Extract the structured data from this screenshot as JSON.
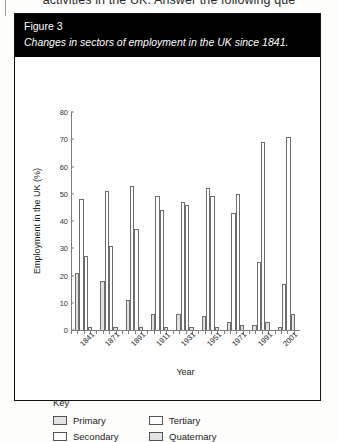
{
  "page": {
    "cut_off_text": "activities in the UK. Answer the following que"
  },
  "figure": {
    "number_label": "Figure 3",
    "caption": "Changes in sectors of employment in the UK since 1841."
  },
  "key": {
    "title": "Key",
    "items": [
      {
        "label": "Primary",
        "style": "fill"
      },
      {
        "label": "Tertiary",
        "style": "empty"
      },
      {
        "label": "Secondary",
        "style": "empty"
      },
      {
        "label": "Quaternary",
        "style": "fill"
      }
    ]
  },
  "chart_data": {
    "type": "bar",
    "title": "Changes in sectors of employment in the UK since 1841.",
    "xlabel": "Year",
    "ylabel": "Employment in the UK (%)",
    "ylim": [
      0,
      80
    ],
    "yticks": [
      0,
      10,
      20,
      30,
      40,
      50,
      60,
      70,
      80
    ],
    "grid": false,
    "legend_position": "below-plot",
    "categories": [
      "1841",
      "1871",
      "1891",
      "1911",
      "1931",
      "1951",
      "1971",
      "1991",
      "2001"
    ],
    "series": [
      {
        "name": "Primary",
        "style": "fill",
        "values": [
          21,
          18,
          11,
          6,
          6,
          5,
          3,
          2,
          1
        ]
      },
      {
        "name": "Secondary",
        "style": "empty",
        "values": [
          48,
          51,
          53,
          49,
          47,
          52,
          43,
          25,
          17
        ]
      },
      {
        "name": "Tertiary",
        "style": "empty",
        "values": [
          27,
          31,
          37,
          44,
          46,
          49,
          50,
          69,
          71
        ]
      },
      {
        "name": "Quaternary",
        "style": "fill",
        "values": [
          1,
          1,
          1,
          1,
          1,
          1,
          2,
          3,
          6
        ]
      }
    ]
  }
}
